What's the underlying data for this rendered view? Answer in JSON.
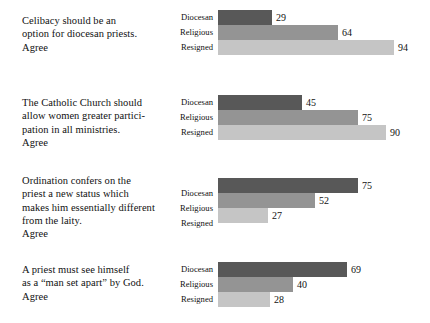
{
  "chart_data": {
    "type": "bar",
    "orientation": "horizontal",
    "title": "",
    "xlabel": "",
    "ylabel": "",
    "xlim": [
      0,
      100
    ],
    "grid": false,
    "legend": "none",
    "series_names": [
      "Diocesan",
      "Religious",
      "Resigned"
    ],
    "series_colors": [
      "#585858",
      "#949494",
      "#c5c5c5"
    ],
    "categories": [
      "Celibacy should be an\noption for diocesan priests.\nAgree",
      "The Catholic Church should\nallow women greater partici-\npation in all ministries.\nAgree",
      "Ordination confers on the\npriest a new status which\nmakes him essentially different\nfrom the laity.\nAgree",
      "A priest must see himself\nas a “man set apart” by God.\nAgree"
    ],
    "series": [
      {
        "name": "Diocesan",
        "values": [
          29,
          45,
          75,
          69
        ]
      },
      {
        "name": "Religious",
        "values": [
          64,
          75,
          52,
          40
        ]
      },
      {
        "name": "Resigned",
        "values": [
          94,
          90,
          27,
          28
        ]
      }
    ],
    "groups": [
      {
        "statement": "Celibacy should be an\noption for diocesan priests.\nAgree",
        "bars": [
          {
            "label": "Diocesan",
            "value": 29,
            "value_text": "29",
            "color": "#585858"
          },
          {
            "label": "Religious",
            "value": 64,
            "value_text": "64",
            "color": "#949494"
          },
          {
            "label": "Resigned",
            "value": 94,
            "value_text": "94",
            "color": "#c5c5c5"
          }
        ]
      },
      {
        "statement": "The Catholic Church should\nallow women greater partici-\npation in all ministries.\nAgree",
        "bars": [
          {
            "label": "Diocesan",
            "value": 45,
            "value_text": "45",
            "color": "#585858"
          },
          {
            "label": "Religious",
            "value": 75,
            "value_text": "75",
            "color": "#949494"
          },
          {
            "label": "Resigned",
            "value": 90,
            "value_text": "90",
            "color": "#c5c5c5"
          }
        ]
      },
      {
        "statement": "Ordination confers on the\npriest a new status which\nmakes him essentially different\nfrom the laity.\nAgree",
        "bars": [
          {
            "label": "Diocesan",
            "value": 75,
            "value_text": "75",
            "color": "#585858"
          },
          {
            "label": "Religious",
            "value": 52,
            "value_text": "52",
            "color": "#949494"
          },
          {
            "label": "Resigned",
            "value": 27,
            "value_text": "27",
            "color": "#c5c5c5"
          }
        ]
      },
      {
        "statement": "A priest must see himself\nas a “man set apart” by God.\nAgree",
        "bars": [
          {
            "label": "Diocesan",
            "value": 69,
            "value_text": "69",
            "color": "#585858"
          },
          {
            "label": "Religious",
            "value": 40,
            "value_text": "40",
            "color": "#949494"
          },
          {
            "label": "Resigned",
            "value": 28,
            "value_text": "28",
            "color": "#c5c5c5"
          }
        ]
      }
    ]
  },
  "layout": {
    "bar_origin_x": 218,
    "px_per_unit": 1.87,
    "bar_height": 15,
    "group_tops": [
      10,
      95,
      178,
      262
    ],
    "statement_tops": [
      14,
      96,
      174,
      263
    ],
    "cat_label_tops": [
      10,
      95,
      186,
      262
    ]
  }
}
